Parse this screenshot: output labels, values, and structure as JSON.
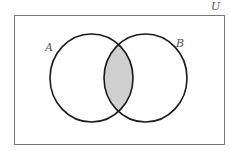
{
  "diagram": {
    "type": "venn",
    "universe_label": "U",
    "sets": [
      {
        "label": "A"
      },
      {
        "label": "B"
      }
    ],
    "shaded_region": "A ∩ B",
    "colors": {
      "stroke": "#1a1a1a",
      "shade": "#d0d0d0",
      "frame": "#777777"
    }
  }
}
